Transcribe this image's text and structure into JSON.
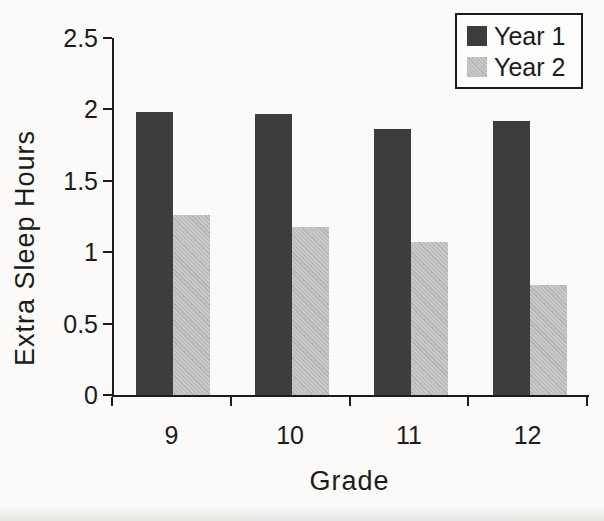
{
  "figure": {
    "background_color": "#fbfaf8",
    "axis_color": "#1c1c1c",
    "text_color": "#1c1c1c"
  },
  "chart_data": {
    "type": "bar",
    "title": "",
    "xlabel": "Grade",
    "ylabel": "Extra Sleep Hours",
    "categories": [
      "9",
      "10",
      "11",
      "12"
    ],
    "series": [
      {
        "name": "Year 1",
        "color": "#3d3d3d",
        "pattern": "solid",
        "values": [
          1.98,
          1.97,
          1.86,
          1.92
        ]
      },
      {
        "name": "Year 2",
        "color": "#c8c8c8",
        "pattern": "diagonal-hatch",
        "hatch_color": "#b2b2b2",
        "values": [
          1.26,
          1.18,
          1.07,
          0.77
        ]
      }
    ],
    "ylim": [
      0,
      2.5
    ],
    "ytick_step": 0.5,
    "yticks": [
      "0",
      "0.5",
      "1",
      "1.5",
      "2",
      "2.5"
    ],
    "grid": false,
    "legend_position": "top-right"
  }
}
